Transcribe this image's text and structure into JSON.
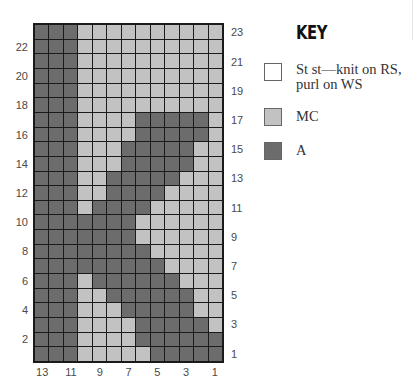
{
  "chart_data": {
    "type": "heatmap",
    "columns": 13,
    "rows": 23,
    "column_order_left_to_right": [
      13,
      12,
      11,
      10,
      9,
      8,
      7,
      6,
      5,
      4,
      3,
      2,
      1
    ],
    "row_order_top_to_bottom": [
      23,
      22,
      21,
      20,
      19,
      18,
      17,
      16,
      15,
      14,
      13,
      12,
      11,
      10,
      9,
      8,
      7,
      6,
      5,
      4,
      3,
      2,
      1
    ],
    "legend": {
      "A": "A (dark)",
      "MC": "MC (light)"
    },
    "grid_rows_top_to_bottom": [
      "AAAMMMMMMMMMM",
      "AAAMMMMMMMMMM",
      "AAAMMMMMMMMMM",
      "AAAMMMMMMMMMM",
      "AAAMMMMMMMMMM",
      "AAAMMMMMMMMMM",
      "AAAMMMMAAAAAM",
      "AAAMMMMAAAAAM",
      "AAAMMMAAAAAMM",
      "AAAMMMAAAAAMM",
      "AAAMMAAAAAMMM",
      "AAAMMAAAAMMMM",
      "AAAMAAAAMMMMM",
      "AAAAAAAMMMMMM",
      "AAAAAAAMMMMMM",
      "AAAAAAAAMMMMM",
      "AAAAAAAAAMMMM",
      "AAAMAAAAAAMMM",
      "AAAMMAAAAAAMM",
      "AAAMMMAAAAAMM",
      "AAAMMMMAAAAAM",
      "AAAMMMMAAAAAA",
      "AAAMMMMMAAAAA"
    ],
    "left_row_labels": [
      "22",
      "20",
      "18",
      "16",
      "14",
      "12",
      "10",
      "8",
      "6",
      "4",
      "2"
    ],
    "right_row_labels": [
      "23",
      "21",
      "19",
      "17",
      "15",
      "13",
      "11",
      "9",
      "7",
      "5",
      "3",
      "1"
    ],
    "bottom_column_labels": [
      "13",
      "11",
      "9",
      "7",
      "5",
      "3",
      "1"
    ]
  },
  "colors": {
    "A": "#6c6c6c",
    "MC": "#c2c2c2",
    "ST": "#ffffff",
    "grid_line": "#1a1a1a"
  },
  "key": {
    "title": "KEY",
    "items": [
      {
        "id": "st",
        "line1": "St st—knit on RS,",
        "line2": "purl on WS",
        "color": "#ffffff"
      },
      {
        "id": "mc",
        "line1": "MC",
        "color": "#c2c2c2"
      },
      {
        "id": "a",
        "line1": "A",
        "color": "#6c6c6c"
      }
    ]
  }
}
